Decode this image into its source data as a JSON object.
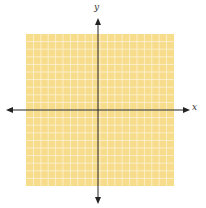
{
  "diagram": {
    "type": "coordinate-plane",
    "grid": {
      "columns": 20,
      "rows": 20,
      "fill": "#f7dc8c",
      "line_color": "#fdf3d6"
    },
    "axes": {
      "x_label": "x",
      "y_label": "y",
      "color": "#222222"
    }
  }
}
